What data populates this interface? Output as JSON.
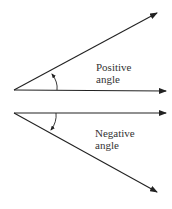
{
  "diagram": {
    "positive": {
      "label_line1": "Positive",
      "label_line2": "angle"
    },
    "negative": {
      "label_line1": "Negative",
      "label_line2": "angle"
    },
    "colors": {
      "line": "#222222",
      "text": "#333333"
    }
  }
}
